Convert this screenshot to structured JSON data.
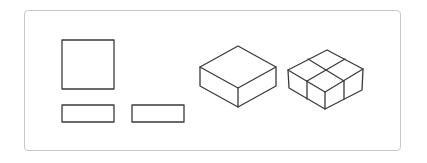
{
  "diagram": {
    "stroke_color": "#3a3a3a",
    "frame_border_color": "#c8c8c8",
    "flat_pieces": [
      {
        "id": "square",
        "shape": "rect",
        "x": 62,
        "y": 40,
        "w": 52,
        "h": 49
      },
      {
        "id": "rect-1",
        "shape": "rect",
        "x": 62,
        "y": 105,
        "w": 52,
        "h": 17
      },
      {
        "id": "rect-2",
        "shape": "rect",
        "x": 132,
        "y": 105,
        "w": 52,
        "h": 17
      }
    ],
    "solids": [
      {
        "id": "box-plain",
        "label": "isometric box"
      },
      {
        "id": "box-divided",
        "label": "isometric box divided into 2x2 blocks"
      }
    ]
  }
}
